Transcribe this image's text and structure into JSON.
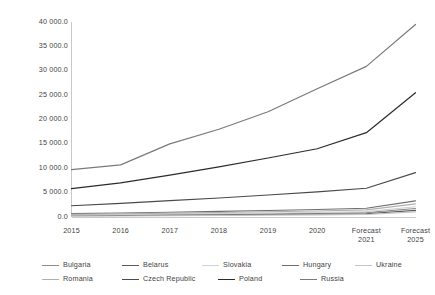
{
  "chart_data": {
    "type": "line",
    "title": "",
    "subtitle": "",
    "xlabel": "",
    "ylabel": "",
    "grid": false,
    "legend_position": "bottom",
    "ylim": [
      0,
      40000
    ],
    "ytick_step": 5000,
    "ytick_labels": [
      "40 000.0",
      "35 000.0",
      "30 000.0",
      "25 000.0",
      "20 000.0",
      "15 000.0",
      "10 000.0",
      "5 000.0",
      "0.0"
    ],
    "ytick_values": [
      40000,
      35000,
      30000,
      25000,
      20000,
      15000,
      10000,
      5000,
      0
    ],
    "categories": [
      "2015",
      "2016",
      "2017",
      "2018",
      "2019",
      "2020",
      "Forecast\n2021",
      "Forecast\n2025"
    ],
    "x": [
      "2015",
      "2016",
      "2017",
      "2018",
      "2019",
      "2020",
      "Forecast 2021",
      "Forecast 2025"
    ],
    "series": [
      {
        "name": "Bulgaria",
        "color": "#8c8c8c",
        "width": 1.1,
        "values": [
          330,
          400,
          480,
          570,
          660,
          760,
          900,
          1750
        ]
      },
      {
        "name": "Belarus",
        "color": "#5a5a5a",
        "width": 1.1,
        "values": [
          250,
          300,
          360,
          430,
          500,
          580,
          680,
          1350
        ]
      },
      {
        "name": "Slovakia",
        "color": "#d2d2d2",
        "width": 1.1,
        "values": [
          420,
          500,
          600,
          700,
          810,
          930,
          1100,
          2100
        ]
      },
      {
        "name": "Hungary",
        "color": "#6e6e6e",
        "width": 1.1,
        "values": [
          700,
          830,
          980,
          1150,
          1330,
          1530,
          1800,
          3300
        ]
      },
      {
        "name": "Ukraine",
        "color": "#c4c4c4",
        "width": 1.1,
        "values": [
          180,
          220,
          270,
          320,
          380,
          440,
          520,
          1050
        ]
      },
      {
        "name": "Romania",
        "color": "#b0b0b0",
        "width": 1.1,
        "values": [
          560,
          670,
          790,
          930,
          1080,
          1240,
          1460,
          2700
        ]
      },
      {
        "name": "Czech Republic",
        "color": "#4a4a4a",
        "width": 1.1,
        "values": [
          2300,
          2800,
          3350,
          3900,
          4500,
          5150,
          5900,
          9100
        ]
      },
      {
        "name": "Poland",
        "color": "#2b2b2b",
        "width": 1.2,
        "values": [
          5800,
          7000,
          8600,
          10300,
          12100,
          14000,
          17300,
          25500
        ]
      },
      {
        "name": "Russia",
        "color": "#7a7a7a",
        "width": 1.2,
        "values": [
          9700,
          10700,
          15000,
          18000,
          21600,
          26300,
          30900,
          39500
        ]
      }
    ],
    "legend_rows": [
      [
        "Bulgaria",
        "Belarus",
        "Slovakia",
        "Hungary",
        "Ukraine"
      ],
      [
        "Romania",
        "Czech Republic",
        "Poland",
        "Russia"
      ]
    ]
  },
  "axes": {
    "frame_color": "#c9c9c9",
    "left_axis_visible": true,
    "bottom_axis_visible": true
  }
}
